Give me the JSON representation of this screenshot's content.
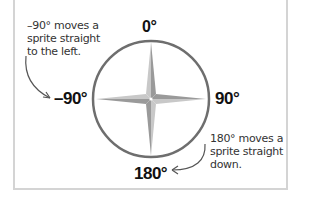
{
  "diagram": {
    "labels": {
      "top": "0°",
      "left": "–90°",
      "right": "90°",
      "bottom": "180°"
    },
    "notes": {
      "left": "–90° moves a\nsprite straight\nto the left.",
      "right": "180° moves a\nsprite straight\ndown."
    },
    "colors": {
      "circle": "#6e6e6e",
      "star_light": "#c8c8c8",
      "star_dark": "#9a9a9a",
      "arrow": "#555555",
      "frame": "#d4d4d4",
      "text": "#111111"
    }
  }
}
